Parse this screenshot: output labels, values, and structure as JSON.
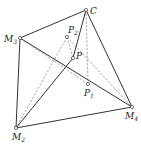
{
  "diagram": {
    "type": "geometric-pyramid",
    "points": {
      "C": {
        "label": "C",
        "sub": "",
        "x": 86,
        "y": 10
      },
      "M3": {
        "label": "M",
        "sub": "3",
        "x": 20,
        "y": 38
      },
      "P2": {
        "label": "P",
        "sub": "2",
        "x": 67,
        "y": 37
      },
      "P": {
        "label": "P",
        "sub": "",
        "x": 73,
        "y": 58
      },
      "P1": {
        "label": "P",
        "sub": "1",
        "x": 88,
        "y": 84
      },
      "M2": {
        "label": "M",
        "sub": "2",
        "x": 16,
        "y": 128
      },
      "M4": {
        "label": "M",
        "sub": "4",
        "x": 132,
        "y": 107
      }
    },
    "solid_edges": [
      [
        "C",
        "M3"
      ],
      [
        "C",
        "M4"
      ],
      [
        "C",
        "P"
      ],
      [
        "M3",
        "M2"
      ],
      [
        "M2",
        "M4"
      ],
      [
        "M2",
        "P"
      ],
      [
        "M3",
        "M4"
      ]
    ],
    "dashed_edges": [
      [
        "C",
        "P1"
      ],
      [
        "M3",
        "P1"
      ],
      [
        "P2",
        "M2"
      ],
      [
        "P2",
        "P"
      ],
      [
        "P2",
        "M4"
      ]
    ]
  }
}
